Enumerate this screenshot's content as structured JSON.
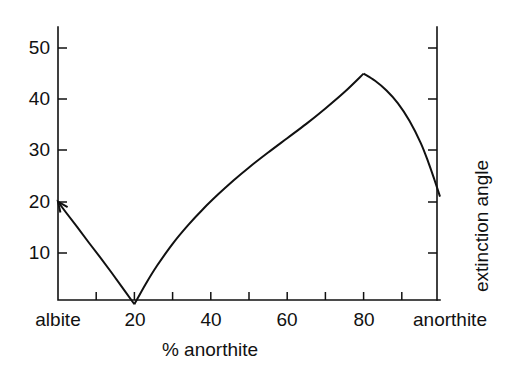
{
  "chart_data": {
    "type": "line",
    "title": "",
    "subtitle": "",
    "xlabel": "% anorthite",
    "ylabel": "",
    "ylabel_right": "extinction angle",
    "xlim": [
      0,
      100
    ],
    "ylim": [
      0,
      54
    ],
    "grid": false,
    "legend": null,
    "x_tick_values": [
      0,
      10,
      20,
      30,
      40,
      50,
      60,
      70,
      80,
      90,
      100
    ],
    "x_tick_labels": [
      "albite",
      "",
      "20",
      "",
      "40",
      "",
      "60",
      "",
      "80",
      "",
      "anorthite"
    ],
    "x_major_labeled": [
      {
        "value": 0,
        "label": "albite"
      },
      {
        "value": 20,
        "label": "20"
      },
      {
        "value": 40,
        "label": "40"
      },
      {
        "value": 60,
        "label": "60"
      },
      {
        "value": 80,
        "label": "80"
      },
      {
        "value": 100,
        "label": "anorthite"
      }
    ],
    "y_tick_values": [
      10,
      20,
      30,
      40,
      50
    ],
    "y_tick_labels": [
      "10",
      "20",
      "30",
      "40",
      "50"
    ],
    "y_right_tick_values": [
      10,
      20,
      30,
      40,
      50
    ],
    "y_right_tick_labels": [
      "",
      "",
      "",
      "",
      ""
    ],
    "series": [
      {
        "name": "extinction angle",
        "color": "#111111",
        "start_marker": "arrowhead",
        "points": [
          {
            "x": 0,
            "y": 20.0
          },
          {
            "x": 2,
            "y": 18.0
          },
          {
            "x": 5,
            "y": 15.1
          },
          {
            "x": 8,
            "y": 12.1
          },
          {
            "x": 11,
            "y": 9.2
          },
          {
            "x": 14,
            "y": 6.2
          },
          {
            "x": 17,
            "y": 3.1
          },
          {
            "x": 20,
            "y": 0.0
          },
          {
            "x": 23,
            "y": 4.0
          },
          {
            "x": 26,
            "y": 7.6
          },
          {
            "x": 30,
            "y": 11.8
          },
          {
            "x": 34,
            "y": 15.4
          },
          {
            "x": 38,
            "y": 18.6
          },
          {
            "x": 42,
            "y": 21.5
          },
          {
            "x": 46,
            "y": 24.2
          },
          {
            "x": 50,
            "y": 26.7
          },
          {
            "x": 55,
            "y": 29.6
          },
          {
            "x": 60,
            "y": 32.4
          },
          {
            "x": 65,
            "y": 35.2
          },
          {
            "x": 70,
            "y": 38.2
          },
          {
            "x": 75,
            "y": 41.4
          },
          {
            "x": 80,
            "y": 45.0
          },
          {
            "x": 83,
            "y": 43.6
          },
          {
            "x": 86,
            "y": 41.7
          },
          {
            "x": 89,
            "y": 39.2
          },
          {
            "x": 92,
            "y": 35.8
          },
          {
            "x": 95,
            "y": 31.4
          },
          {
            "x": 97,
            "y": 27.6
          },
          {
            "x": 98.5,
            "y": 24.4
          },
          {
            "x": 100,
            "y": 21.0
          }
        ],
        "annotations": [
          {
            "text": "arrow at left end pointing to y = 20 on left axis",
            "x": 0,
            "y": 20
          }
        ]
      }
    ],
    "notable_points": [
      {
        "label": "start",
        "x": 0,
        "y": 20
      },
      {
        "label": "minimum",
        "x": 20,
        "y": 0
      },
      {
        "label": "maximum",
        "x": 80,
        "y": 45
      },
      {
        "label": "end",
        "x": 100,
        "y": 21
      }
    ]
  },
  "axes": {
    "left_title": "",
    "right_title": "extinction angle",
    "bottom_title": "% anorthite",
    "left_tick_labels": [
      "50",
      "40",
      "30",
      "20",
      "10"
    ],
    "bottom_tick_labels": [
      "albite",
      "20",
      "40",
      "60",
      "80",
      "anorthite"
    ]
  },
  "colors": {
    "line": "#111111",
    "axis": "#111111",
    "text": "#111111",
    "background": "#ffffff"
  }
}
